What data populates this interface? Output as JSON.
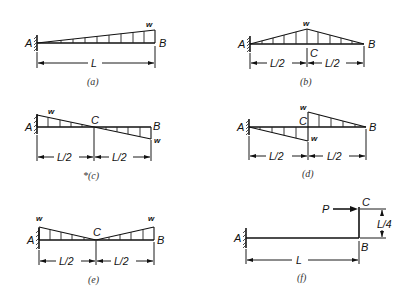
{
  "figures": [
    {
      "id": "a",
      "caption": "(a)",
      "support_label": "A",
      "end_label": "B",
      "load_label": "w",
      "span_label": "L",
      "load_type": "triangular increasing from A to B"
    },
    {
      "id": "b",
      "caption": "(b)",
      "support_label": "A",
      "mid_label": "C",
      "end_label": "B",
      "load_label": "w",
      "span_labels": [
        "L/2",
        "L/2"
      ],
      "load_type": "triangular peaking at midspan C"
    },
    {
      "id": "c",
      "caption": "*(c)",
      "support_label": "A",
      "mid_label": "C",
      "end_label": "B",
      "load_labels": [
        "w",
        "w"
      ],
      "span_labels": [
        "L/2",
        "L/2"
      ],
      "load_type": "linearly varying, w downward at A to w upward at B, zero at C"
    },
    {
      "id": "d",
      "caption": "(d)",
      "support_label": "A",
      "mid_label": "C",
      "end_label": "B",
      "load_labels": [
        "w",
        "w"
      ],
      "span_labels": [
        "L/2",
        "L/2"
      ],
      "load_type": "upward triangle A to C, downward triangle C to B"
    },
    {
      "id": "e",
      "caption": "(e)",
      "support_label": "A",
      "mid_label": "C",
      "end_label": "B",
      "load_labels": [
        "w",
        "w"
      ],
      "span_labels": [
        "L/2",
        "L/2"
      ],
      "load_type": "V-shaped, w at A and B, zero at C"
    },
    {
      "id": "f",
      "caption": "(f)",
      "support_label": "A",
      "end_label": "B",
      "top_label": "C",
      "force_label": "P",
      "span_label": "L",
      "arm_label": "L/4",
      "load_type": "horizontal point load P at top of vertical arm BC"
    }
  ]
}
